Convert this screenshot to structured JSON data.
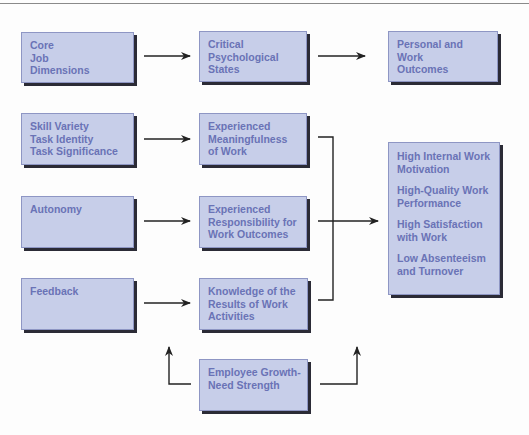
{
  "diagram": {
    "type": "flow-model",
    "colors": {
      "box_fill": "#c7cee9",
      "box_text": "#6a73b6",
      "box_shadow": "#2b2b36",
      "connector": "#222222"
    },
    "header_row": {
      "core_job_dimensions": [
        "Core",
        "Job",
        "Dimensions"
      ],
      "critical_psychological_states": [
        "Critical",
        "Psychological",
        "States"
      ],
      "personal_and_work_outcomes": [
        "Personal and",
        "Work",
        "Outcomes"
      ]
    },
    "dimensions": {
      "skill_task": [
        "Skill Variety",
        "Task Identity",
        "Task Significance"
      ],
      "autonomy": [
        "Autonomy"
      ],
      "feedback": [
        "Feedback"
      ]
    },
    "states": {
      "meaningfulness": [
        "Experienced",
        "Meaningfulness",
        "of Work"
      ],
      "responsibility": [
        "Experienced",
        "Responsibility for",
        "Work Outcomes"
      ],
      "knowledge": [
        "Knowledge of the",
        "Results of Work",
        "Activities"
      ]
    },
    "outcomes": [
      [
        "High Internal Work",
        "Motivation"
      ],
      [
        "High-Quality Work",
        "Performance"
      ],
      [
        "High Satisfaction",
        "with Work"
      ],
      [
        "Low Absenteeism",
        "and Turnover"
      ]
    ],
    "moderator": [
      "Employee Growth-",
      "Need Strength"
    ]
  }
}
